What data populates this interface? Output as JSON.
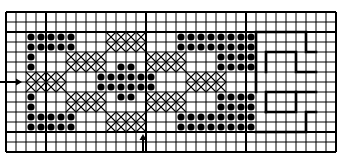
{
  "diagram": {
    "type": "stitch-pattern-grid",
    "grid": {
      "origin_x": 6,
      "origin_y": 12,
      "cell": 10,
      "cols": 33,
      "rows": 14,
      "thick_cols": [
        0,
        4,
        14,
        24,
        33
      ],
      "thick_rows": [
        0,
        2,
        12,
        14
      ],
      "line_color": "#000000",
      "thin_width": 1,
      "thick_width": 2
    },
    "dots": [
      {
        "row": 2,
        "cols": [
          2,
          3,
          4,
          5,
          6,
          17,
          18,
          19,
          20,
          21,
          22,
          23,
          24
        ]
      },
      {
        "row": 3,
        "cols": [
          2,
          3,
          4,
          5,
          6,
          17,
          18,
          19,
          20,
          21,
          22,
          23,
          24
        ]
      },
      {
        "row": 4,
        "cols": [
          2,
          21,
          22,
          23,
          24
        ]
      },
      {
        "row": 5,
        "cols": [
          2,
          11,
          12,
          21,
          22,
          23,
          24
        ]
      },
      {
        "row": 6,
        "cols": [
          9,
          10,
          11,
          12,
          13,
          14
        ]
      },
      {
        "row": 7,
        "cols": [
          9,
          10,
          11,
          12,
          13,
          14
        ]
      },
      {
        "row": 8,
        "cols": [
          2,
          11,
          12,
          21,
          22,
          23,
          24
        ]
      },
      {
        "row": 9,
        "cols": [
          2,
          21,
          22,
          23,
          24
        ]
      },
      {
        "row": 10,
        "cols": [
          2,
          3,
          4,
          5,
          6,
          17,
          18,
          19,
          20,
          21,
          22,
          23,
          24
        ]
      },
      {
        "row": 11,
        "cols": [
          2,
          3,
          4,
          5,
          6,
          17,
          18,
          19,
          20,
          21,
          22,
          23,
          24
        ]
      }
    ],
    "crosses": [
      {
        "rows": [
          2,
          3
        ],
        "cols": [
          10,
          11,
          12,
          13
        ]
      },
      {
        "rows": [
          4,
          5
        ],
        "cols": [
          6,
          7,
          8,
          9
        ]
      },
      {
        "rows": [
          4,
          5
        ],
        "cols": [
          14,
          15,
          16,
          17
        ]
      },
      {
        "rows": [
          6,
          7
        ],
        "cols": [
          2,
          3,
          4,
          5
        ]
      },
      {
        "rows": [
          6,
          7
        ],
        "cols": [
          18,
          19,
          20,
          21
        ]
      },
      {
        "rows": [
          8,
          9
        ],
        "cols": [
          6,
          7,
          8,
          9
        ]
      },
      {
        "rows": [
          8,
          9
        ],
        "cols": [
          14,
          15,
          16,
          17
        ]
      },
      {
        "rows": [
          10,
          11
        ],
        "cols": [
          10,
          11,
          12,
          13
        ]
      }
    ],
    "outline_paths": [
      [
        [
          256,
          92
        ],
        [
          256,
          32
        ],
        [
          306,
          32
        ],
        [
          306,
          52
        ],
        [
          316,
          52
        ]
      ],
      [
        [
          266,
          72
        ],
        [
          266,
          52
        ],
        [
          296,
          52
        ],
        [
          296,
          72
        ],
        [
          316,
          72
        ]
      ],
      [
        [
          266,
          112
        ],
        [
          266,
          92
        ],
        [
          316,
          92
        ]
      ],
      [
        [
          266,
          112
        ],
        [
          296,
          112
        ],
        [
          296,
          92
        ]
      ],
      [
        [
          316,
          112
        ],
        [
          306,
          112
        ],
        [
          306,
          132
        ],
        [
          256,
          132
        ]
      ]
    ],
    "markers": [
      {
        "name": "left-center-arrow",
        "direction": "right",
        "x1": 0,
        "y1": 82,
        "x2": 20,
        "y2": 82
      },
      {
        "name": "bottom-center-arrow",
        "direction": "up",
        "x1": 143,
        "y1": 153,
        "x2": 143,
        "y2": 136
      }
    ],
    "colors": {
      "ink": "#000000",
      "paper": "#ffffff"
    }
  }
}
